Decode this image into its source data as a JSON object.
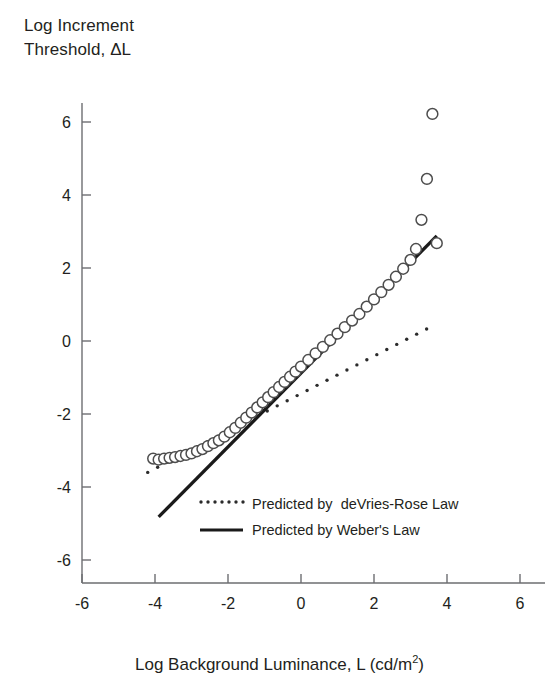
{
  "chart_data": {
    "type": "scatter",
    "title": "",
    "ylabel": "Log Increment Threshold, ΔL",
    "ylabel_line1": "Log Increment",
    "ylabel_line2": "Threshold, ΔL",
    "xlabel": "Log Background Luminance, L (cd/m",
    "xlabel_sup": "2",
    "xlabel_tail": ")",
    "xlim": [
      -6,
      6
    ],
    "ylim": [
      -6,
      6
    ],
    "xticks": [
      "-6",
      "-4",
      "-2",
      "0",
      "2",
      "4",
      "6"
    ],
    "xtick_values": [
      -6,
      -4,
      -2,
      0,
      2,
      4,
      6
    ],
    "yticks": [
      "6",
      "4",
      "2",
      "0",
      "-2",
      "-4",
      "-6"
    ],
    "ytick_values": [
      6,
      4,
      2,
      0,
      -2,
      -4,
      -6
    ],
    "grid": false,
    "marker": "open-circle",
    "marker_color": "#000000",
    "legend_position": "lower-center",
    "series": [
      {
        "name": "Measured increment threshold",
        "type": "scatter",
        "marker": "open-circle",
        "x": [
          -4.05,
          -3.9,
          -3.75,
          -3.6,
          -3.45,
          -3.3,
          -3.15,
          -3.0,
          -2.85,
          -2.7,
          -2.55,
          -2.4,
          -2.25,
          -2.1,
          -1.95,
          -1.8,
          -1.65,
          -1.5,
          -1.35,
          -1.2,
          -1.05,
          -0.9,
          -0.75,
          -0.6,
          -0.45,
          -0.3,
          -0.15,
          0.0,
          0.2,
          0.4,
          0.6,
          0.8,
          1.0,
          1.2,
          1.4,
          1.6,
          1.8,
          2.0,
          2.2,
          2.4,
          2.6,
          2.8,
          3.0,
          3.15,
          3.3,
          3.45,
          3.6,
          3.72
        ],
        "y": [
          -3.22,
          -3.25,
          -3.22,
          -3.2,
          -3.18,
          -3.15,
          -3.12,
          -3.08,
          -3.02,
          -2.96,
          -2.88,
          -2.8,
          -2.72,
          -2.62,
          -2.5,
          -2.38,
          -2.24,
          -2.1,
          -1.96,
          -1.82,
          -1.68,
          -1.54,
          -1.4,
          -1.26,
          -1.12,
          -0.98,
          -0.84,
          -0.7,
          -0.52,
          -0.34,
          -0.16,
          0.02,
          0.2,
          0.38,
          0.56,
          0.74,
          0.94,
          1.14,
          1.34,
          1.54,
          1.76,
          1.98,
          2.22,
          2.52,
          3.32,
          4.44,
          6.22,
          2.68
        ]
      },
      {
        "name": "Predicted by deVries-Rose Law",
        "type": "line",
        "style": "dotted",
        "x": [
          -4.2,
          3.7
        ],
        "y": [
          -3.6,
          0.46
        ]
      },
      {
        "name": "Predicted by Weber's Law",
        "type": "line",
        "style": "solid",
        "x": [
          -3.9,
          3.72
        ],
        "y": [
          -4.82,
          2.88
        ]
      }
    ]
  },
  "legend": {
    "items": [
      {
        "label": "Predicted by  deVries-Rose Law",
        "style": "dotted"
      },
      {
        "label": "Predicted by Weber's Law",
        "style": "solid"
      }
    ]
  },
  "axes": {
    "y_title_line1": "Log Increment",
    "y_title_line2": "Threshold, ΔL",
    "x_title_main": "Log Background Luminance, L (cd/m",
    "x_title_sup": "2",
    "x_title_end": ")"
  },
  "colors": {
    "axis": "#6d6e71",
    "text": "#231f20",
    "marker_stroke": "#4d4d4d",
    "weber_line": "#1a1a1a",
    "devries_dots": "#2b2b2b"
  }
}
